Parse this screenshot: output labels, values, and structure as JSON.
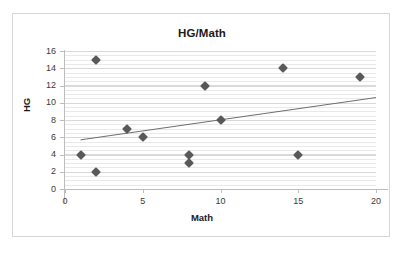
{
  "chart_data": {
    "type": "scatter",
    "title": "HG/Math",
    "xlabel": "Math",
    "ylabel": "HG",
    "xlim": [
      0,
      20
    ],
    "ylim": [
      0,
      16
    ],
    "xticks": [
      0,
      5,
      10,
      15,
      20
    ],
    "yticks": [
      0,
      2,
      4,
      6,
      8,
      10,
      12,
      14,
      16
    ],
    "grid": "horizontal-major-and-minor",
    "legend": "none",
    "marker_color": "#595959",
    "trendline_color": "#6e6e6e",
    "grid_color": "#e9e9e9",
    "axis_color": "#bdbdbd",
    "points": [
      {
        "x": 1,
        "y": 4
      },
      {
        "x": 2,
        "y": 15
      },
      {
        "x": 2,
        "y": 2
      },
      {
        "x": 4,
        "y": 7
      },
      {
        "x": 5,
        "y": 6
      },
      {
        "x": 8,
        "y": 4
      },
      {
        "x": 8,
        "y": 3
      },
      {
        "x": 9,
        "y": 12
      },
      {
        "x": 10,
        "y": 8
      },
      {
        "x": 14,
        "y": 14
      },
      {
        "x": 15,
        "y": 4
      },
      {
        "x": 19,
        "y": 13
      }
    ],
    "trendline": {
      "type": "linear",
      "x0": 1.0,
      "y0": 5.7,
      "x1": 20.0,
      "y1": 10.6
    }
  }
}
